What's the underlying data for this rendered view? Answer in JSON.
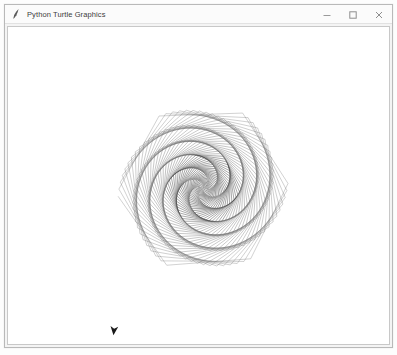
{
  "window": {
    "title": "Python Turtle Graphics",
    "icon": "python-feather-icon",
    "controls": [
      {
        "name": "minimize-button",
        "glyph": "minimize-icon",
        "label": "─"
      },
      {
        "name": "maximize-button",
        "glyph": "maximize-icon",
        "label": "□"
      },
      {
        "name": "close-button",
        "glyph": "close-icon",
        "label": "✕"
      }
    ],
    "frame_color": "#b9b9b9",
    "titlebar_color": "#fbfbfb",
    "title_color": "#3b3b3b"
  },
  "canvas": {
    "name": "turtle-drawing-canvas",
    "background": "#ffffff",
    "border_color": "#c8c8c8",
    "width": 383,
    "height": 318
  },
  "drawing": {
    "type": "turtle-spirograph",
    "description": "Spiral polygon pattern drawn with increasing segment length and constant turn angle",
    "center_x": 198,
    "center_y": 186,
    "origin_x": 195,
    "origin_y": 161,
    "segments": 420,
    "turn_angle_deg": 59.2,
    "step_start": 1.0,
    "step_increment": 0.82,
    "start_heading_deg": -90,
    "stroke_color": "#6e6e6e",
    "stroke_color_dark": "#3c3c3c",
    "stroke_width": 0.45,
    "scale": 0.245,
    "arms": 6,
    "turtle": {
      "name": "turtle-cursor",
      "x": 113,
      "y": 330,
      "heading_deg": 96,
      "color": "#1a1a1a",
      "size": 5.2
    }
  },
  "chart_data": {
    "type": "line",
    "xlabel": "",
    "ylabel": "",
    "series": [
      {
        "name": "spiral-polygon-path",
        "turn_angle_deg": 59.2,
        "step_start": 1.0,
        "step_increment": 0.82,
        "segment_count": 420
      }
    ]
  }
}
